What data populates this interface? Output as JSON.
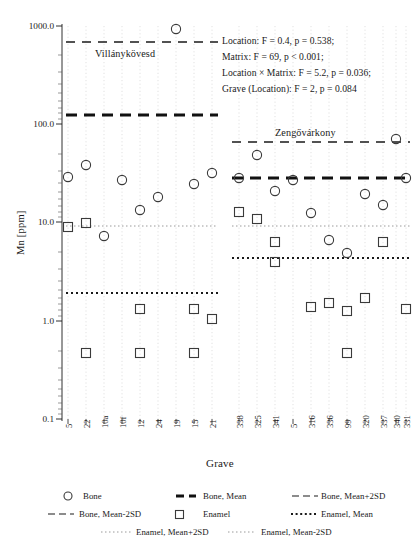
{
  "chart_data": {
    "type": "scatter",
    "title": "",
    "xlabel": "Grave",
    "ylabel": "Mn [ppm]",
    "yscale": "log",
    "ylim": [
      0.1,
      1000.0
    ],
    "yticks": [
      "0.1",
      "1.0",
      "10.0",
      "100.0",
      "1000.0"
    ],
    "ytick_values": [
      0.1,
      1.0,
      10.0,
      100.0,
      1000.0
    ],
    "grid": "vertical-dotted",
    "legend_position": "bottom",
    "categories": [
      "5",
      "22",
      "10a",
      "10f",
      "12",
      "24",
      "19",
      "15",
      "21",
      "338",
      "325",
      "341",
      "5",
      "316",
      "336",
      "99",
      "320",
      "337",
      "340",
      "331"
    ],
    "groups": [
      {
        "name": "Villánykövesd",
        "label": "Villánykövesd",
        "categories": [
          "5",
          "22",
          "10a",
          "10f",
          "12",
          "24",
          "19",
          "15",
          "21"
        ],
        "bone_mean": 135.0,
        "bone_mean_plus_2sd": 670.0,
        "bone_mean_minus_2sd": null,
        "enamel_mean": 3.2,
        "enamel_mean_plus_2sd": 9.6,
        "enamel_mean_minus_2sd": null
      },
      {
        "name": "Zengővárkony",
        "label": "Zengővárkony",
        "categories": [
          "338",
          "325",
          "341",
          "5",
          "316",
          "336",
          "99",
          "320",
          "337",
          "340",
          "331"
        ],
        "bone_mean": 28.0,
        "bone_mean_plus_2sd": 65.0,
        "bone_mean_minus_2sd": null,
        "enamel_mean": 5.0,
        "enamel_mean_plus_2sd": 9.6,
        "enamel_mean_minus_2sd": null
      }
    ],
    "series": [
      {
        "name": "Bone",
        "marker": "circle",
        "points": [
          {
            "category": "5",
            "value": 31.0
          },
          {
            "category": "22",
            "value": 41.0
          },
          {
            "category": "10a",
            "value": 7.4
          },
          {
            "category": "10f",
            "value": 29.0
          },
          {
            "category": "12",
            "value": 14.5
          },
          {
            "category": "24",
            "value": 19.5
          },
          {
            "category": "19",
            "value": 940.0
          },
          {
            "category": "15",
            "value": 26.5
          },
          {
            "category": "21",
            "value": 34.0
          },
          {
            "category": "338",
            "value": 29.0
          },
          {
            "category": "325",
            "value": 50.0
          },
          {
            "category": "341",
            "value": 21.5
          },
          {
            "category": "5",
            "value": 27.5
          },
          {
            "category": "316",
            "value": 12.8
          },
          {
            "category": "336",
            "value": 6.8
          },
          {
            "category": "99",
            "value": 5.0
          },
          {
            "category": "320",
            "value": 20.0
          },
          {
            "category": "337",
            "value": 15.5
          },
          {
            "category": "340",
            "value": 74.0
          },
          {
            "category": "331",
            "value": 28.5
          }
        ]
      },
      {
        "name": "Enamel",
        "marker": "square",
        "points": [
          {
            "category": "5",
            "value": 8.2
          },
          {
            "category": "22",
            "value": 9.0
          },
          {
            "category": "22",
            "value": 0.5
          },
          {
            "category": "12",
            "value": 2.3
          },
          {
            "category": "15",
            "value": 2.3
          },
          {
            "category": "15",
            "value": 0.5
          },
          {
            "category": "21",
            "value": 1.85
          },
          {
            "category": "21",
            "value": 0.5
          },
          {
            "category": "338",
            "value": 13.2
          },
          {
            "category": "325",
            "value": 11.3
          },
          {
            "category": "341",
            "value": 7.2
          },
          {
            "category": "341",
            "value": 4.6
          },
          {
            "category": "316",
            "value": 2.4
          },
          {
            "category": "336",
            "value": 2.6
          },
          {
            "category": "99",
            "value": 2.25
          },
          {
            "category": "99",
            "value": 0.5
          },
          {
            "category": "320",
            "value": 2.8
          },
          {
            "category": "337",
            "value": 7.2
          },
          {
            "category": "331",
            "value": 2.3
          }
        ]
      }
    ],
    "annotations": [
      "Location: F = 0.4, p = 0.538;",
      "Matrix: F = 69, p < 0.001;",
      "Location × Matrix: F = 5.2, p = 0.036;",
      "Grave (Location): F = 2, p = 0.084"
    ]
  },
  "axes": {
    "y_title": "Mn [ppm]",
    "x_title": "Grave",
    "y_ticks": [
      "1000.0",
      "100.0",
      "10.0",
      "1.0",
      "0.1"
    ],
    "x_ticks": [
      "5",
      "22",
      "10a",
      "10f",
      "12",
      "24",
      "19",
      "15",
      "21",
      "338",
      "325",
      "341",
      "5",
      "316",
      "336",
      "99",
      "320",
      "337",
      "340",
      "331"
    ]
  },
  "site_labels": {
    "left": "Villánykövesd",
    "right": "Zengővárkony"
  },
  "stats": {
    "line1": "Location: F = 0.4, p = 0.538;",
    "line2": "Matrix: F = 69, p < 0.001;",
    "line3": "Location × Matrix: F = 5.2, p = 0.036;",
    "line4": "Grave (Location): F = 2, p = 0.084"
  },
  "legend": {
    "items": [
      {
        "label": "Bone",
        "marker": "circle"
      },
      {
        "label": "Bone, Mean",
        "marker": "thick-dashed"
      },
      {
        "label": "Bone, Mean+2SD",
        "marker": "dashed"
      },
      {
        "label": "Bone, Mean-2SD",
        "marker": "dashed"
      },
      {
        "label": "Enamel",
        "marker": "square"
      },
      {
        "label": "Enamel, Mean",
        "marker": "dotted-bold"
      },
      {
        "label": "Enamel, Mean+2SD",
        "marker": "dotted-fine"
      },
      {
        "label": "Enamel, Mean-2SD",
        "marker": "dotted-fine"
      }
    ]
  },
  "colors": {
    "ink": "#1a1a1a",
    "marker": "#3a3a3a",
    "grid": "#cccccc",
    "background": "#ffffff"
  }
}
